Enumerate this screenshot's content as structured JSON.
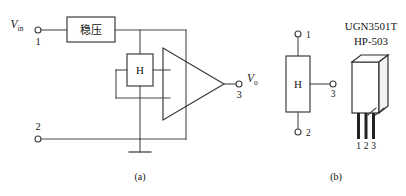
{
  "figure": {
    "panels": [
      {
        "id": "a",
        "caption": "(a)",
        "name": "internal-block-schematic",
        "blocks": [
          {
            "name": "regulator",
            "label": "稳压"
          },
          {
            "name": "hall-element",
            "label": "H"
          },
          {
            "name": "differential-amplifier",
            "label": ""
          }
        ],
        "terminals": [
          {
            "number": "1",
            "signal": "V",
            "subscript": "in"
          },
          {
            "number": "2",
            "signal": "",
            "subscript": ""
          },
          {
            "number": "3",
            "signal": "V",
            "subscript": "o"
          }
        ],
        "ground_symbol": "earth-ground"
      },
      {
        "id": "b",
        "caption": "(b)",
        "name": "symbol-and-package",
        "hall_symbol_label": "H",
        "symbol_terminals": [
          "1",
          "2",
          "3"
        ],
        "part_numbers": [
          "UGN3501T",
          "HP-503"
        ],
        "package_pins": [
          "1",
          "2",
          "3"
        ]
      }
    ]
  },
  "labels": {
    "vin_letter": "V",
    "vin_sub": "in",
    "vout_letter": "V",
    "vout_sub": "o",
    "terminal_1": "1",
    "terminal_2": "2",
    "terminal_3": "3",
    "regulator_cjk": "稳压",
    "hall_a": "H",
    "hall_b": "H",
    "b_term_1": "1",
    "b_term_2": "2",
    "b_term_3": "3",
    "part_line_1": "UGN3501T",
    "part_line_2": "HP-503",
    "pkg_pin_1": "1",
    "pkg_pin_2": "2",
    "pkg_pin_3": "3",
    "caption_a": "(a)",
    "caption_b": "(b)"
  },
  "colors": {
    "wire": "#4a4a4a",
    "outline": "#3d3d3d",
    "text": "#161616",
    "background": "#ffffff",
    "pin_fill": "#222222"
  }
}
